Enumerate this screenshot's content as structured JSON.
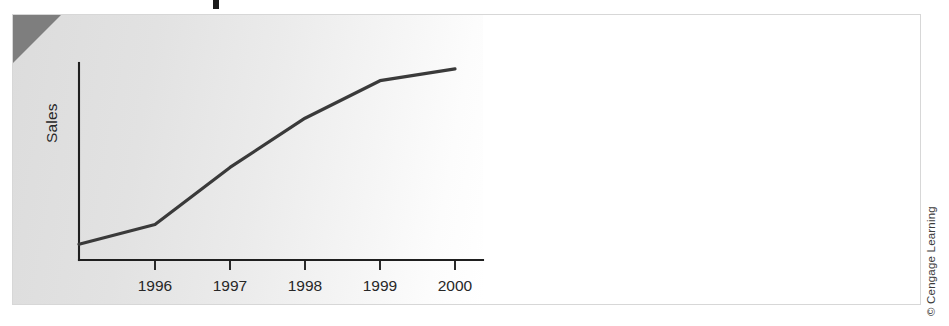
{
  "figure": {
    "credit": "© Cengage Learning",
    "title_fragment_visible": true,
    "corner_wedge_color": "#7e7e7e",
    "plate_color": "#e2e2e2",
    "border_color": "#d7d7d7"
  },
  "chart_data": {
    "type": "line",
    "title": "",
    "xlabel": "",
    "ylabel": "Sales",
    "categories": [
      "1996",
      "1997",
      "1998",
      "1999",
      "2000"
    ],
    "x": [
      1996,
      1997,
      1998,
      1999,
      2000
    ],
    "series": [
      {
        "name": "Sales",
        "values": [
          18,
          47,
          72,
          91,
          97
        ],
        "color": "#3a3a3a"
      }
    ],
    "xlim": [
      1995.0,
      2000.4
    ],
    "ylim": [
      0,
      100
    ],
    "y_tick_labels": [],
    "x_tick_labels": [
      "1996",
      "1997",
      "1998",
      "1999",
      "2000"
    ],
    "grid": false,
    "legend": false,
    "legend_position": "none",
    "annotations": [],
    "start_point_value": 8
  }
}
